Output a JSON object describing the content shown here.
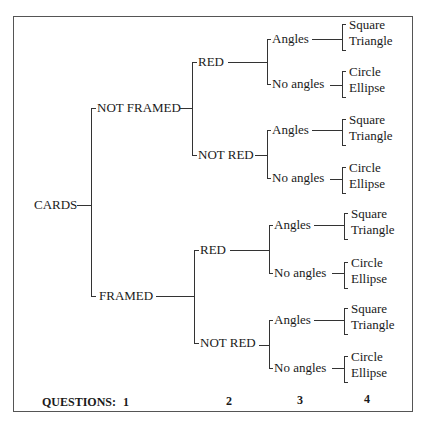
{
  "diagram": {
    "root": "CARDS",
    "level1": [
      "NOT FRAMED",
      "FRAMED"
    ],
    "level2": [
      "RED",
      "NOT RED",
      "RED",
      "NOT RED"
    ],
    "level3": [
      "Angles",
      "No angles",
      "Angles",
      "No angles",
      "Angles",
      "No angles",
      "Angles",
      "No angles"
    ],
    "leaves": [
      [
        "Square",
        "Triangle"
      ],
      [
        "Circle",
        "Ellipse"
      ],
      [
        "Square",
        "Triangle"
      ],
      [
        "Circle",
        "Ellipse"
      ],
      [
        "Square",
        "Triangle"
      ],
      [
        "Circle",
        "Ellipse"
      ],
      [
        "Square",
        "Triangle"
      ],
      [
        "Circle",
        "Ellipse"
      ]
    ]
  },
  "footer": {
    "label": "QUESTIONS:",
    "numbers": [
      "1",
      "2",
      "3",
      "4"
    ]
  }
}
